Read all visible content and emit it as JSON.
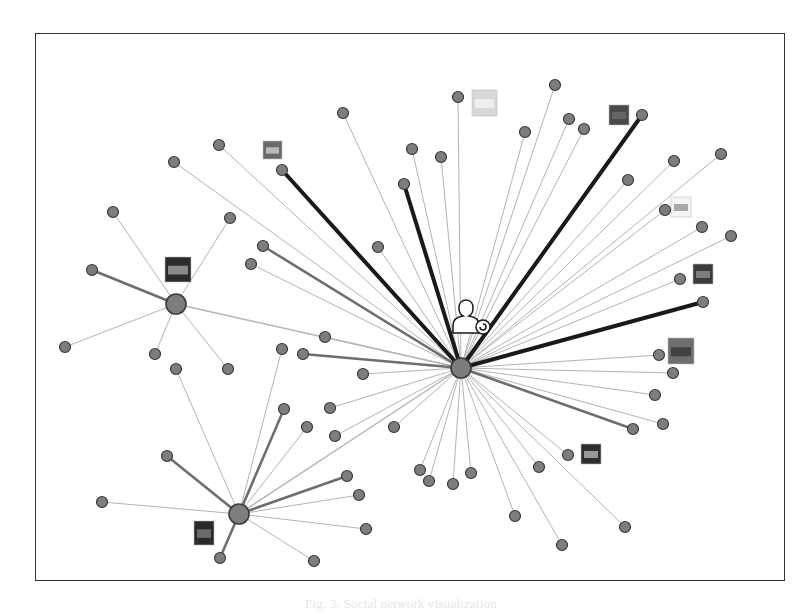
{
  "figure": {
    "caption": "Fig. 3. Social network visualization"
  },
  "colors": {
    "node_fill": "#7d7d7d",
    "node_stroke": "#3a3a3a",
    "edge_light": "#b4b4b4",
    "edge_medium": "#6e6e6e",
    "edge_heavy": "#1a1a1a",
    "frame": "#333333"
  },
  "hubs": [
    {
      "id": "hub-center",
      "x": 461,
      "y": 368,
      "r": 10
    },
    {
      "id": "hub-left",
      "x": 176,
      "y": 304,
      "r": 10
    },
    {
      "id": "hub-lower",
      "x": 239,
      "y": 514,
      "r": 10
    }
  ],
  "nodes": [
    {
      "x": 113,
      "y": 212,
      "hub": 1,
      "w": 1
    },
    {
      "x": 230,
      "y": 218,
      "hub": 1,
      "w": 1
    },
    {
      "x": 92,
      "y": 270,
      "hub": 1,
      "w": 2
    },
    {
      "x": 65,
      "y": 347,
      "hub": 1,
      "w": 1
    },
    {
      "x": 155,
      "y": 354,
      "hub": 1,
      "w": 1
    },
    {
      "x": 228,
      "y": 369,
      "hub": 1,
      "w": 1
    },
    {
      "x": 176,
      "y": 369,
      "hub": 2,
      "w": 1
    },
    {
      "x": 167,
      "y": 456,
      "hub": 2,
      "w": 2
    },
    {
      "x": 102,
      "y": 502,
      "hub": 2,
      "w": 1
    },
    {
      "x": 220,
      "y": 558,
      "hub": 2,
      "w": 2
    },
    {
      "x": 314,
      "y": 561,
      "hub": 2,
      "w": 1
    },
    {
      "x": 284,
      "y": 409,
      "hub": 2,
      "w": 2
    },
    {
      "x": 307,
      "y": 427,
      "hub": 2,
      "w": 1
    },
    {
      "x": 347,
      "y": 476,
      "hub": 2,
      "w": 2
    },
    {
      "x": 359,
      "y": 495,
      "hub": 2,
      "w": 1
    },
    {
      "x": 366,
      "y": 529,
      "hub": 2,
      "w": 1
    },
    {
      "x": 282,
      "y": 349,
      "hub": 2,
      "w": 1
    },
    {
      "x": 174,
      "y": 162,
      "hub": 0,
      "w": 1
    },
    {
      "x": 219,
      "y": 145,
      "hub": 0,
      "w": 1
    },
    {
      "x": 282,
      "y": 170,
      "hub": 0,
      "w": 3
    },
    {
      "x": 343,
      "y": 113,
      "hub": 0,
      "w": 1
    },
    {
      "x": 404,
      "y": 184,
      "hub": 0,
      "w": 3
    },
    {
      "x": 412,
      "y": 149,
      "hub": 0,
      "w": 1
    },
    {
      "x": 441,
      "y": 157,
      "hub": 0,
      "w": 1
    },
    {
      "x": 458,
      "y": 97,
      "hub": 0,
      "w": 1
    },
    {
      "x": 525,
      "y": 132,
      "hub": 0,
      "w": 1
    },
    {
      "x": 555,
      "y": 85,
      "hub": 0,
      "w": 1
    },
    {
      "x": 569,
      "y": 119,
      "hub": 0,
      "w": 1
    },
    {
      "x": 584,
      "y": 129,
      "hub": 0,
      "w": 1
    },
    {
      "x": 642,
      "y": 115,
      "hub": 0,
      "w": 3
    },
    {
      "x": 628,
      "y": 180,
      "hub": 0,
      "w": 1
    },
    {
      "x": 674,
      "y": 161,
      "hub": 0,
      "w": 1
    },
    {
      "x": 721,
      "y": 154,
      "hub": 0,
      "w": 1
    },
    {
      "x": 665,
      "y": 210,
      "hub": 0,
      "w": 1
    },
    {
      "x": 702,
      "y": 227,
      "hub": 0,
      "w": 1
    },
    {
      "x": 731,
      "y": 236,
      "hub": 0,
      "w": 1
    },
    {
      "x": 680,
      "y": 279,
      "hub": 0,
      "w": 1
    },
    {
      "x": 703,
      "y": 302,
      "hub": 0,
      "w": 3
    },
    {
      "x": 659,
      "y": 355,
      "hub": 0,
      "w": 1
    },
    {
      "x": 673,
      "y": 373,
      "hub": 0,
      "w": 1
    },
    {
      "x": 655,
      "y": 395,
      "hub": 0,
      "w": 1
    },
    {
      "x": 663,
      "y": 424,
      "hub": 0,
      "w": 1
    },
    {
      "x": 633,
      "y": 429,
      "hub": 0,
      "w": 2
    },
    {
      "x": 263,
      "y": 246,
      "hub": 0,
      "w": 2
    },
    {
      "x": 251,
      "y": 264,
      "hub": 0,
      "w": 1
    },
    {
      "x": 378,
      "y": 247,
      "hub": 0,
      "w": 1
    },
    {
      "x": 325,
      "y": 337,
      "hub": 0,
      "w": 1
    },
    {
      "x": 303,
      "y": 354,
      "hub": 0,
      "w": 2
    },
    {
      "x": 363,
      "y": 374,
      "hub": 0,
      "w": 1
    },
    {
      "x": 330,
      "y": 408,
      "hub": 0,
      "w": 1
    },
    {
      "x": 335,
      "y": 436,
      "hub": 0,
      "w": 1
    },
    {
      "x": 394,
      "y": 427,
      "hub": 0,
      "w": 1
    },
    {
      "x": 420,
      "y": 470,
      "hub": 0,
      "w": 1
    },
    {
      "x": 429,
      "y": 481,
      "hub": 0,
      "w": 1
    },
    {
      "x": 453,
      "y": 484,
      "hub": 0,
      "w": 1
    },
    {
      "x": 471,
      "y": 473,
      "hub": 0,
      "w": 1
    },
    {
      "x": 539,
      "y": 467,
      "hub": 0,
      "w": 1
    },
    {
      "x": 568,
      "y": 455,
      "hub": 0,
      "w": 1
    },
    {
      "x": 515,
      "y": 516,
      "hub": 0,
      "w": 1
    },
    {
      "x": 562,
      "y": 545,
      "hub": 0,
      "w": 1
    },
    {
      "x": 625,
      "y": 527,
      "hub": 0,
      "w": 1
    }
  ],
  "cross_edges": [
    {
      "from": [
        176,
        304
      ],
      "to": [
        461,
        368
      ]
    },
    {
      "from": [
        239,
        514
      ],
      "to": [
        461,
        368
      ]
    }
  ],
  "thumbnails": [
    {
      "id": "thumb-landscape",
      "x": 165,
      "y": 257,
      "w": 26,
      "h": 25,
      "fill": "#2b2b2b",
      "inner": "#9a9a9a"
    },
    {
      "id": "thumb-pin",
      "x": 263,
      "y": 141,
      "w": 19,
      "h": 18,
      "fill": "#6a6a6a",
      "inner": "#c8c8c8"
    },
    {
      "id": "thumb-silhouette",
      "x": 472,
      "y": 90,
      "w": 25,
      "h": 26,
      "fill": "#d8d8d8",
      "inner": "#f2f2f2"
    },
    {
      "id": "thumb-dark-photo",
      "x": 609,
      "y": 105,
      "w": 20,
      "h": 20,
      "fill": "#4a4a4a",
      "inner": "#6a6a6a"
    },
    {
      "id": "thumb-sun",
      "x": 671,
      "y": 197,
      "w": 20,
      "h": 20,
      "fill": "#f4f4f4",
      "inner": "#9a9a9a"
    },
    {
      "id": "thumb-street",
      "x": 693,
      "y": 264,
      "w": 20,
      "h": 20,
      "fill": "#3c3c3c",
      "inner": "#8a8a8a"
    },
    {
      "id": "thumb-portrait",
      "x": 668,
      "y": 338,
      "w": 26,
      "h": 26,
      "fill": "#6e6e6e",
      "inner": "#3a3a3a"
    },
    {
      "id": "thumb-dog",
      "x": 581,
      "y": 444,
      "w": 20,
      "h": 20,
      "fill": "#2e2e2e",
      "inner": "#aaaaaa"
    },
    {
      "id": "thumb-figure",
      "x": 194,
      "y": 521,
      "w": 20,
      "h": 24,
      "fill": "#2a2a2a",
      "inner": "#777777"
    }
  ],
  "ego_icon": {
    "x": 453,
    "y": 300,
    "w": 26,
    "h": 34,
    "badge_x": 483,
    "badge_y": 327
  }
}
